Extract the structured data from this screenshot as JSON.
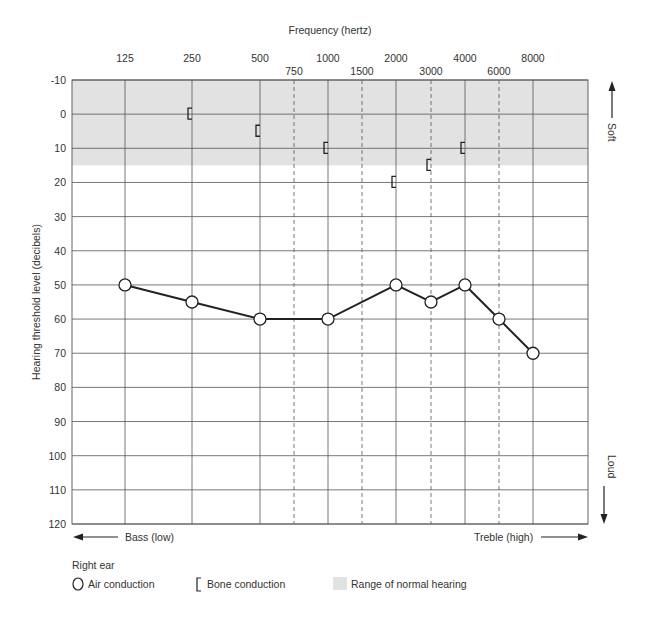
{
  "chart_data": {
    "type": "line",
    "title": "Frequency (hertz)",
    "xlabel": "Frequency (hertz)",
    "ylabel": "Hearing threshold level (decibels)",
    "x_major_ticks": [
      "125",
      "250",
      "500",
      "1000",
      "2000",
      "4000",
      "8000"
    ],
    "x_minor_ticks": [
      "750",
      "1500",
      "3000",
      "6000"
    ],
    "y_ticks": [
      -10,
      0,
      10,
      20,
      30,
      40,
      50,
      60,
      70,
      80,
      90,
      100,
      110,
      120
    ],
    "ylim": [
      -10,
      120
    ],
    "y_inverted": true,
    "grid": true,
    "normal_range": {
      "from": -10,
      "to": 15,
      "color": "#e2e2e2",
      "label": "Range of normal hearing"
    },
    "series": [
      {
        "name": "Air conduction",
        "marker": "circle",
        "x": [
          "125",
          "250",
          "500",
          "1000",
          "2000",
          "3000",
          "4000",
          "6000",
          "8000"
        ],
        "values": [
          50,
          55,
          60,
          60,
          50,
          55,
          50,
          60,
          70
        ]
      },
      {
        "name": "Bone conduction",
        "marker": "bracket",
        "x": [
          "250",
          "500",
          "1000",
          "2000",
          "3000",
          "4000"
        ],
        "values": [
          0,
          5,
          10,
          20,
          15,
          10
        ]
      }
    ],
    "annotations": {
      "soft": "Soft",
      "loud": "Loud",
      "bass": "Bass (low)",
      "treble": "Treble (high)"
    },
    "legend": {
      "title": "Right ear",
      "items": [
        "Air conduction",
        "Bone conduction",
        "Range of normal hearing"
      ],
      "position": "bottom-left"
    }
  }
}
